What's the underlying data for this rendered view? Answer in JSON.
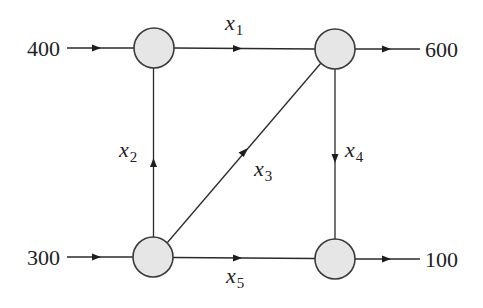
{
  "diagram": {
    "type": "network-flow",
    "colors": {
      "node_fill": "#e6e6e6",
      "node_stroke": "#3a3a3a",
      "edge": "#2a2a2a",
      "text": "#222222"
    },
    "nodes": [
      {
        "id": "A",
        "position": "top-left"
      },
      {
        "id": "B",
        "position": "top-right"
      },
      {
        "id": "C",
        "position": "bottom-left"
      },
      {
        "id": "D",
        "position": "bottom-right"
      }
    ],
    "external_flows": {
      "in_top_left": {
        "value": "400",
        "direction": "in"
      },
      "in_bottom_left": {
        "value": "300",
        "direction": "in"
      },
      "out_top_right": {
        "value": "600",
        "direction": "out"
      },
      "out_bottom_right": {
        "value": "100",
        "direction": "out"
      }
    },
    "edges": {
      "x1": {
        "var": "x",
        "sub": "1",
        "from": "A",
        "to": "B"
      },
      "x2": {
        "var": "x",
        "sub": "2",
        "from": "C",
        "to": "A"
      },
      "x3": {
        "var": "x",
        "sub": "3",
        "from": "C",
        "to": "B"
      },
      "x4": {
        "var": "x",
        "sub": "4",
        "from": "B",
        "to": "D"
      },
      "x5": {
        "var": "x",
        "sub": "5",
        "from": "C",
        "to": "D"
      }
    }
  }
}
